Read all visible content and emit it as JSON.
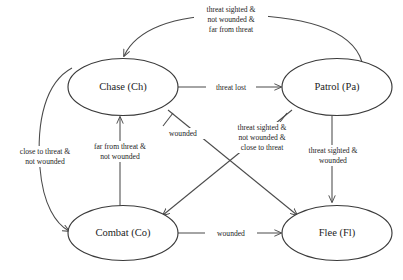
{
  "diagram": {
    "type": "finite-state-machine",
    "title": "",
    "background_color": "#ffffff",
    "stroke_color": "#4a4a4a",
    "text_color": "#1d1d1d",
    "nodes": [
      {
        "id": "Ch",
        "label": "Chase (Ch)",
        "cx": 123,
        "cy": 87,
        "rx": 55,
        "ry": 28.5
      },
      {
        "id": "Pa",
        "label": "Patrol (Pa)",
        "cx": 337,
        "cy": 87,
        "rx": 55,
        "ry": 28.5
      },
      {
        "id": "Co",
        "label": "Combat (Co)",
        "cx": 123,
        "cy": 233,
        "rx": 55,
        "ry": 27.5
      },
      {
        "id": "Fl",
        "label": "Flee (Fl)",
        "cx": 337,
        "cy": 233,
        "rx": 55,
        "ry": 27.5
      }
    ],
    "edges": [
      {
        "from": "Pa",
        "to": "Ch",
        "label_lines": [
          "threat sighted &",
          "not wounded &",
          "far from threat"
        ],
        "label_x": 231,
        "label_y": 13
      },
      {
        "from": "Ch",
        "to": "Pa",
        "label_lines": [
          "threat lost"
        ],
        "label_x": 231,
        "label_y": 89
      },
      {
        "from": "Ch",
        "to": "Co",
        "label_lines": [
          "close to threat &",
          "not wounded"
        ],
        "label_x": 45,
        "label_y": 157
      },
      {
        "from": "Co",
        "to": "Ch",
        "label_lines": [
          "far from threat &",
          "not wounded"
        ],
        "label_x": 120,
        "label_y": 152
      },
      {
        "from": "Ch",
        "to": "Fl",
        "label_lines": [
          "wounded"
        ],
        "label_x": 183,
        "label_y": 135
      },
      {
        "from": "Pa",
        "to": "Co",
        "label_lines": [
          "threat sighted &",
          "not wounded &",
          "close to threat"
        ],
        "label_x": 262,
        "label_y": 131
      },
      {
        "from": "Pa",
        "to": "Fl",
        "label_lines": [
          "threat sighted &",
          "wounded"
        ],
        "label_x": 332,
        "label_y": 156
      },
      {
        "from": "Co",
        "to": "Fl",
        "label_lines": [
          "wounded"
        ],
        "label_x": 231,
        "label_y": 235
      }
    ]
  }
}
